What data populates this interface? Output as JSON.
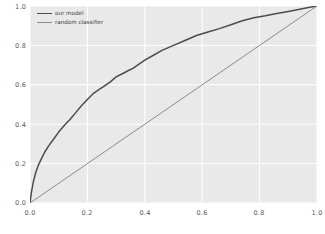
{
  "figure": {
    "background_color": "#ffffff",
    "axes_background_color": "#e9e9e9",
    "grid_color": "#ffffff"
  },
  "legend": {
    "position": "upper-left",
    "entries": [
      {
        "label": "our model",
        "color": "#4c4c4c"
      },
      {
        "label": "random classifier",
        "color": "#8a8a8a"
      }
    ]
  },
  "axis": {
    "x_ticks": [
      "0.0",
      "0.2",
      "0.4",
      "0.6",
      "0.8",
      "1.0"
    ],
    "y_ticks": [
      "0.0",
      "0.2",
      "0.4",
      "0.6",
      "0.8",
      "1.0"
    ]
  },
  "chart_data": {
    "type": "line",
    "title": "",
    "xlabel": "",
    "ylabel": "",
    "xlim": [
      0.0,
      1.0
    ],
    "ylim": [
      0.0,
      1.0
    ],
    "xticks": [
      0.0,
      0.2,
      0.4,
      0.6,
      0.8,
      1.0
    ],
    "yticks": [
      0.0,
      0.2,
      0.4,
      0.6,
      0.8,
      1.0
    ],
    "grid": true,
    "legend_position": "upper-left",
    "series": [
      {
        "name": "our model",
        "color": "#4c4c4c",
        "linewidth": 1.5,
        "x": [
          0.0,
          0.005,
          0.012,
          0.02,
          0.03,
          0.04,
          0.05,
          0.065,
          0.08,
          0.1,
          0.12,
          0.14,
          0.16,
          0.18,
          0.2,
          0.22,
          0.24,
          0.26,
          0.28,
          0.3,
          0.32,
          0.34,
          0.36,
          0.38,
          0.4,
          0.43,
          0.46,
          0.5,
          0.54,
          0.58,
          0.62,
          0.66,
          0.7,
          0.74,
          0.78,
          0.82,
          0.86,
          0.9,
          0.94,
          0.97,
          1.0
        ],
        "y": [
          0.0,
          0.055,
          0.11,
          0.155,
          0.195,
          0.225,
          0.255,
          0.29,
          0.32,
          0.36,
          0.395,
          0.425,
          0.46,
          0.495,
          0.525,
          0.555,
          0.575,
          0.595,
          0.615,
          0.64,
          0.655,
          0.67,
          0.685,
          0.705,
          0.725,
          0.75,
          0.775,
          0.8,
          0.825,
          0.85,
          0.868,
          0.885,
          0.905,
          0.925,
          0.94,
          0.95,
          0.962,
          0.972,
          0.983,
          0.992,
          1.0
        ]
      },
      {
        "name": "random classifier",
        "color": "#8a8a8a",
        "linewidth": 1.0,
        "x": [
          0.0,
          1.0
        ],
        "y": [
          0.0,
          1.0
        ]
      }
    ]
  }
}
